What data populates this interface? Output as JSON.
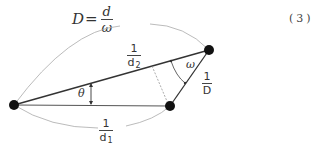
{
  "equation": {
    "lhs": "D",
    "equals": "=",
    "numerator": "d",
    "denominator": "ω",
    "number": "(3)"
  },
  "diagram": {
    "points": [
      {
        "id": "left",
        "x": 14,
        "y": 105
      },
      {
        "id": "top-right",
        "x": 209,
        "y": 50
      },
      {
        "id": "bottom-right",
        "x": 170,
        "y": 106
      }
    ],
    "labels": {
      "upper_arc": {
        "numerator": "1",
        "denominator": "d",
        "subscript": "2"
      },
      "lower_arc": {
        "numerator": "1",
        "denominator": "d",
        "subscript": "1"
      },
      "right_side": {
        "numerator": "1",
        "denominator": "D"
      },
      "angle_theta": "θ",
      "angle_omega": "ω"
    }
  }
}
